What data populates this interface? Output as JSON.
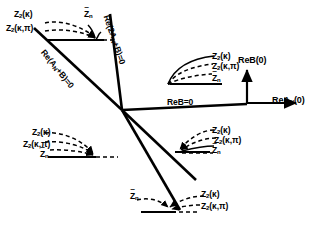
{
  "figure": {
    "type": "phase-diagram",
    "background": "#ffffff",
    "ink": "#000000"
  },
  "axes": {
    "vertical_label": "ReB(0)",
    "horizontal_label_main": "ReA",
    "horizontal_label_sub": "N",
    "horizontal_label_tail": "(0)",
    "origin_x": 247,
    "origin_y": 103
  },
  "lines": {
    "line1_label_main": "Re(A",
    "line1_label_sub": "N",
    "line1_label_tail": "+B)=0",
    "line2_label_main": "Re(2A",
    "line2_label_sub": "N",
    "line2_label_tail": "+B)=0",
    "line3_label": "ReB=0"
  },
  "flow_groups": [
    {
      "id": "top-left",
      "labels": [
        {
          "text": "Z",
          "sub": "2",
          "arg": "(κ)"
        },
        {
          "text": "Z",
          "sub": "2",
          "arg": "(κ,π)"
        },
        {
          "text": "Z",
          "sub": "n",
          "tilde": true
        }
      ]
    },
    {
      "id": "upper-right",
      "labels": [
        {
          "text": "Z",
          "sub": "2",
          "arg": "(κ)"
        },
        {
          "text": "Z",
          "sub": "2",
          "arg": "(κ,π)"
        },
        {
          "text": "Z",
          "sub": "n",
          "tilde": true
        }
      ]
    },
    {
      "id": "lower-left",
      "labels": [
        {
          "text": "Z",
          "sub": "2",
          "arg": "(κ)"
        },
        {
          "text": "Z",
          "sub": "2",
          "arg": "(κ,π)"
        },
        {
          "text": "Z",
          "sub": "n",
          "tilde": true
        }
      ]
    },
    {
      "id": "mid-right",
      "labels": [
        {
          "text": "Z",
          "sub": "2",
          "arg": "(κ)"
        },
        {
          "text": "Z",
          "sub": "2",
          "arg": "(κ,π)"
        },
        {
          "text": "Z",
          "sub": "n",
          "tilde": true
        }
      ]
    },
    {
      "id": "bottom",
      "labels": [
        {
          "text": "Z",
          "sub": "n",
          "tilde": true
        },
        {
          "text": "Z",
          "sub": "2",
          "arg": "(κ)"
        },
        {
          "text": "Z",
          "sub": "2",
          "arg": "(κ,π)"
        }
      ]
    }
  ],
  "text": {
    "tl_z2k": "Z",
    "sub2": "2",
    "subn": "n",
    "argk": "(κ)",
    "argkp": "(κ,π)",
    "tilde": "~",
    "reb0": "ReB=0",
    "reB0axis": "ReB(0)",
    "reA": "ReA",
    "subN": "N",
    "paren0": "(0)",
    "reAnB": "Re(A",
    "reAnB_tail": "+B)=0",
    "re2AnB": "Re(2A",
    "re2AnB_tail": "+B)=0"
  }
}
